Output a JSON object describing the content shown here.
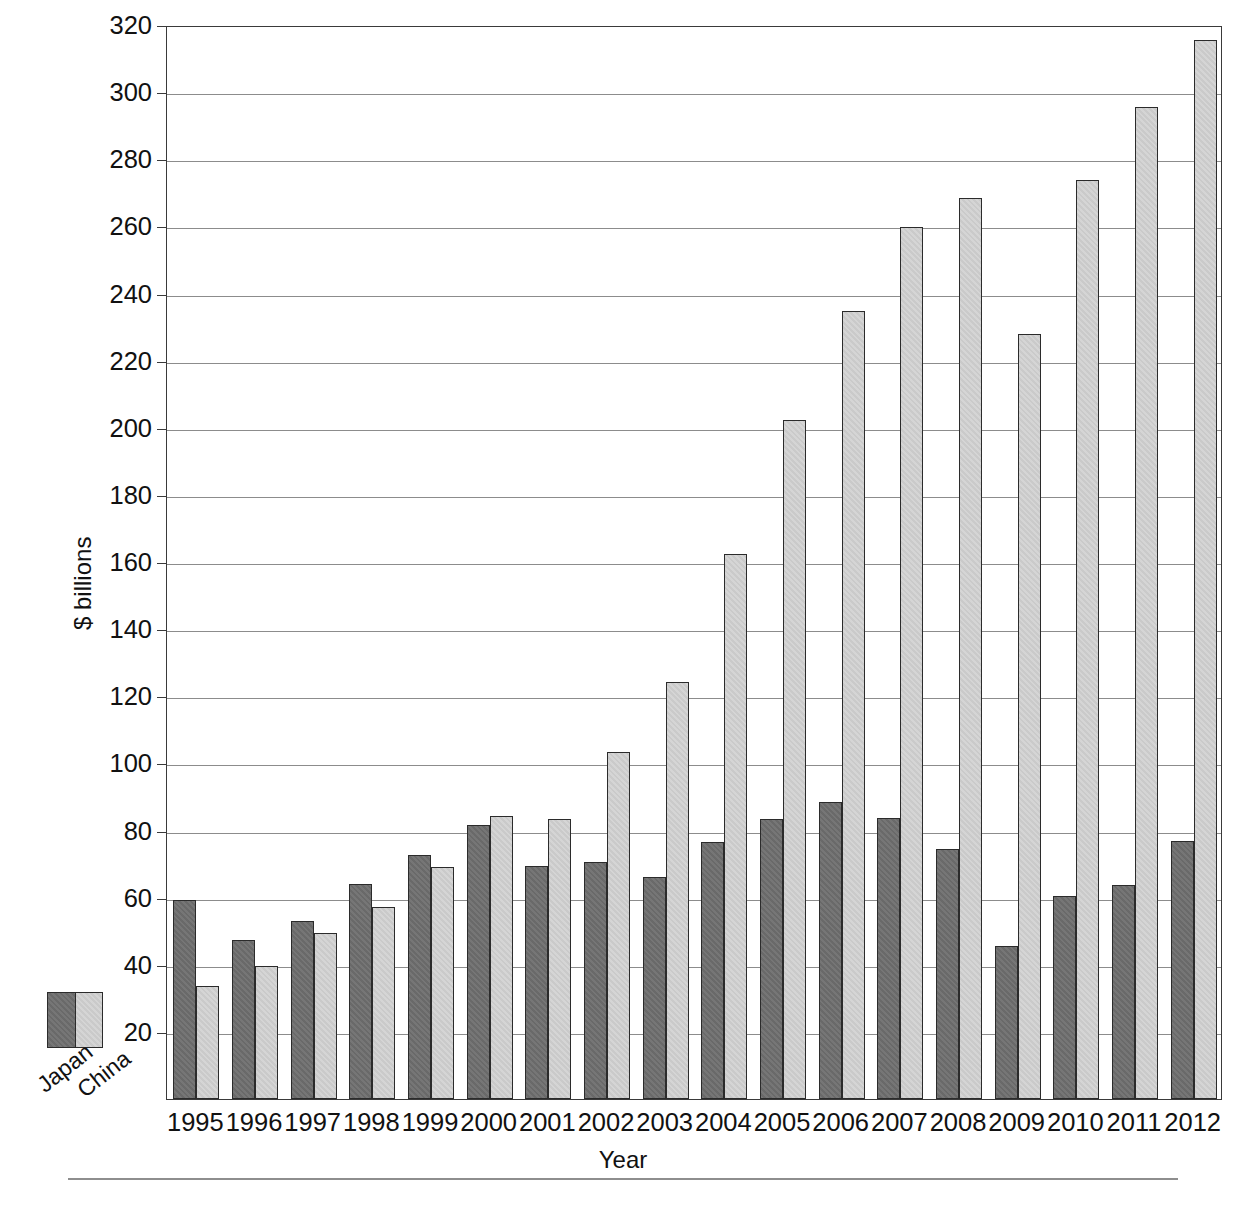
{
  "chart_data": {
    "type": "bar",
    "title": "",
    "xlabel": "Year",
    "ylabel": "$ billions",
    "ylim": [
      0,
      320
    ],
    "ytick_step": 20,
    "yticks": [
      20,
      40,
      60,
      80,
      100,
      120,
      140,
      160,
      180,
      200,
      220,
      240,
      260,
      280,
      300,
      320
    ],
    "grid": true,
    "legend_position": "bottom-left",
    "categories": [
      "1995",
      "1996",
      "1997",
      "1998",
      "1999",
      "2000",
      "2001",
      "2002",
      "2003",
      "2004",
      "2005",
      "2006",
      "2007",
      "2008",
      "2009",
      "2010",
      "2011",
      "2012"
    ],
    "series": [
      {
        "name": "Japan",
        "color": "#6f6f6f",
        "values": [
          59.3,
          47.3,
          53.0,
          64.2,
          72.8,
          81.6,
          69.4,
          70.5,
          66.2,
          76.5,
          83.5,
          88.5,
          83.6,
          74.6,
          45.5,
          60.6,
          63.7,
          76.8
        ]
      },
      {
        "name": "China",
        "color": "#d3d3d3",
        "values": [
          33.7,
          39.5,
          49.6,
          57.1,
          69.0,
          84.3,
          83.3,
          103.4,
          124.3,
          162.3,
          202.4,
          234.8,
          259.8,
          268.6,
          227.8,
          273.7,
          295.6,
          315.6
        ]
      }
    ]
  },
  "axes": {
    "y_title": "$ billions",
    "x_title": "Year"
  },
  "legend": {
    "items": [
      {
        "label": "Japan",
        "color": "#6f6f6f"
      },
      {
        "label": "China",
        "color": "#d3d3d3"
      }
    ]
  }
}
